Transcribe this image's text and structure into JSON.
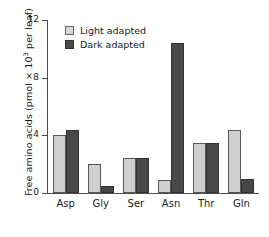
{
  "chart_data": {
    "type": "bar",
    "title": "",
    "xlabel": "",
    "ylabel": "Free amino acids (pmol × 10³ per leaf)",
    "ylabel_prefix": "Free amino acids (pmol × 10",
    "ylabel_exponent": "3",
    "ylabel_suffix": " per leaf)",
    "categories": [
      "Asp",
      "Gly",
      "Ser",
      "Asn",
      "Thr",
      "Gln"
    ],
    "series": [
      {
        "name": "Light adapted",
        "color": "#cfcfcf",
        "values": [
          4.0,
          2.0,
          2.4,
          0.9,
          3.5,
          4.4
        ]
      },
      {
        "name": "Dark adapted",
        "color": "#484848",
        "values": [
          4.4,
          0.5,
          2.4,
          10.4,
          3.5,
          1.0
        ]
      }
    ],
    "ylim": [
      0,
      12
    ],
    "yticks": [
      0,
      4,
      8,
      12
    ],
    "ytick_labels": [
      "0",
      "4",
      "8",
      "12"
    ],
    "grid": false,
    "legend_position": "top-left-inside"
  },
  "legend": {
    "items": [
      {
        "label": "Light adapted",
        "swatch": "light"
      },
      {
        "label": "Dark adapted",
        "swatch": "dark"
      }
    ]
  },
  "colors": {
    "light_bar": "#cfcfcf",
    "dark_bar": "#484848",
    "axis": "#4d4d4d",
    "text": "#1a1a1a",
    "background": "#ffffff"
  }
}
